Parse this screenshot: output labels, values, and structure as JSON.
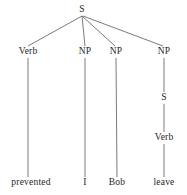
{
  "figure": {
    "type": "syntax-tree",
    "background_color": "#ffffff",
    "edge_color": "#6b6b6b",
    "text_color": "#262626",
    "width": 187,
    "height": 195
  },
  "nodes": [
    {
      "id": "root-s",
      "label": "S",
      "x": 82,
      "y": 10
    },
    {
      "id": "verb-1",
      "label": "Verb",
      "x": 28,
      "y": 52
    },
    {
      "id": "np-1",
      "label": "NP",
      "x": 85,
      "y": 52
    },
    {
      "id": "np-2",
      "label": "NP",
      "x": 116,
      "y": 52
    },
    {
      "id": "np-3",
      "label": "NP",
      "x": 164,
      "y": 52
    },
    {
      "id": "embedded-s",
      "label": "S",
      "x": 164,
      "y": 98
    },
    {
      "id": "verb-2",
      "label": "Verb",
      "x": 164,
      "y": 138
    }
  ],
  "leaves": [
    {
      "id": "leaf-prevented",
      "label": "prevented",
      "x": 31,
      "y": 183
    },
    {
      "id": "leaf-i",
      "label": "I",
      "x": 85,
      "y": 183
    },
    {
      "id": "leaf-bob",
      "label": "Bob",
      "x": 117,
      "y": 183
    },
    {
      "id": "leaf-leave",
      "label": "leave",
      "x": 164,
      "y": 183
    }
  ],
  "edges": [
    {
      "id": "edge-root-verb1",
      "x1": 82,
      "y1": 16,
      "x2": 28,
      "y2": 46
    },
    {
      "id": "edge-root-np1",
      "x1": 82,
      "y1": 16,
      "x2": 85,
      "y2": 46
    },
    {
      "id": "edge-root-np2",
      "x1": 82,
      "y1": 16,
      "x2": 115,
      "y2": 46
    },
    {
      "id": "edge-root-np3",
      "x1": 83,
      "y1": 16,
      "x2": 163,
      "y2": 46
    },
    {
      "id": "edge-verb1-leaf",
      "x1": 28,
      "y1": 58,
      "x2": 28,
      "y2": 177
    },
    {
      "id": "edge-np1-leaf",
      "x1": 85,
      "y1": 58,
      "x2": 85,
      "y2": 177
    },
    {
      "id": "edge-np2-leaf",
      "x1": 116,
      "y1": 58,
      "x2": 117,
      "y2": 177
    },
    {
      "id": "edge-np3-s",
      "x1": 164,
      "y1": 58,
      "x2": 164,
      "y2": 92
    },
    {
      "id": "edge-s-verb2",
      "x1": 164,
      "y1": 104,
      "x2": 164,
      "y2": 132
    },
    {
      "id": "edge-verb2-leaf",
      "x1": 164,
      "y1": 144,
      "x2": 164,
      "y2": 177
    }
  ]
}
